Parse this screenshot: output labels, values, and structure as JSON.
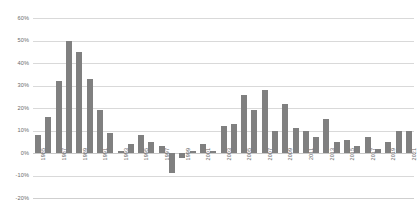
{
  "chart_data": {
    "type": "bar",
    "title": "",
    "subtitle": "",
    "xlabel": "",
    "ylabel": "",
    "ylim": [
      -20,
      60
    ],
    "ytick_step": 10,
    "grid": true,
    "legend": false,
    "legend_position": "none",
    "value_suffix": "%",
    "bar_color": "#808080",
    "gridline_color": "#d9d9d9",
    "axis_text_color": "#6b6b6b",
    "ytick_labels": [
      "60%",
      "50%",
      "40%",
      "30%",
      "20%",
      "10%",
      "0%",
      "-10%",
      "-20%"
    ],
    "ytick_values": [
      60,
      50,
      40,
      30,
      20,
      10,
      0,
      -10,
      -20
    ],
    "xtick_labels": [
      "1985",
      "1987",
      "1989",
      "1991",
      "1993",
      "1995",
      "1997",
      "1999",
      "2001",
      "2003",
      "2005",
      "2007",
      "2009",
      "2011",
      "2013",
      "2015",
      "2017",
      "2019",
      "2021"
    ],
    "categories": [
      "1985",
      "1986",
      "1987",
      "1988",
      "1989",
      "1990",
      "1991",
      "1992",
      "1993",
      "1994",
      "1995",
      "1996",
      "1997",
      "1998",
      "1999",
      "2000",
      "2001",
      "2002",
      "2003",
      "2004",
      "2005",
      "2006",
      "2007",
      "2008",
      "2009",
      "2010",
      "2011",
      "2012",
      "2013",
      "2014",
      "2015",
      "2016",
      "2017",
      "2018",
      "2019",
      "2020",
      "2021"
    ],
    "values": [
      8,
      16,
      32,
      50,
      45,
      33,
      19,
      9,
      1,
      4,
      8,
      5,
      3,
      -9,
      -2,
      1,
      4,
      1,
      12,
      13,
      26,
      19,
      28,
      10,
      22,
      11,
      10,
      7,
      15,
      5,
      6,
      3,
      7,
      2,
      5,
      10,
      10
    ]
  }
}
